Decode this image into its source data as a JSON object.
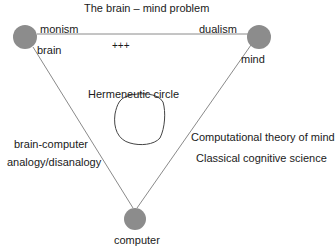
{
  "title": "The brain – mind problem",
  "nodes": {
    "brain": {
      "label": "brain",
      "cx": 25,
      "cy": 37,
      "r": 12
    },
    "mind": {
      "label": "mind",
      "cx": 259,
      "cy": 37,
      "r": 12
    },
    "computer": {
      "label": "computer",
      "cx": 135,
      "cy": 219,
      "r": 11
    }
  },
  "edges": {
    "top": {
      "left_label": "monism",
      "right_label": "dualism",
      "mid_label": "+++"
    },
    "left": {
      "line1": "brain-computer",
      "line2": "analogy/disanalogy"
    },
    "right": {
      "line1": "Computational theory of mind",
      "line2": "Classical cognitive science"
    }
  },
  "center": {
    "label": "Hermeneutic circle"
  },
  "colors": {
    "node": "#8c8c8c",
    "line": "#8a8a8a",
    "text": "#1a1a1a"
  }
}
